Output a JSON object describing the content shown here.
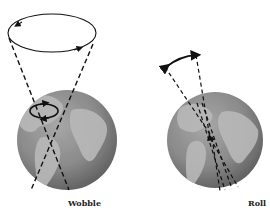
{
  "diagram": {
    "panels": [
      {
        "id": "wobble",
        "label": "Wobble"
      },
      {
        "id": "roll",
        "label": "Roll"
      }
    ]
  },
  "colors": {
    "background": "#ffffff",
    "globe_ocean": "#8a8a8a",
    "globe_land": "#b4b4b4",
    "lines": "#111111"
  },
  "icons": {
    "wobble_motion": "circular-arrow-icon",
    "roll_motion": "double-arrow-arc-icon"
  }
}
